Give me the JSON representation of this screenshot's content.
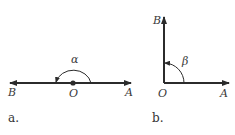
{
  "figures": [
    {
      "caption": "a.",
      "angle_label": "α",
      "points": {
        "left": "B",
        "center": "O",
        "right": "A"
      },
      "description": "Straight angle AOB with rays OA and OB in opposite directions"
    },
    {
      "caption": "b.",
      "angle_label": "β",
      "points": {
        "top": "B",
        "vertex": "O",
        "right": "A"
      },
      "description": "Right angle AOB with ray OB vertical and ray OA horizontal"
    }
  ],
  "colors": {
    "line": "#2b2b2b",
    "text": "#3a3a3a"
  }
}
